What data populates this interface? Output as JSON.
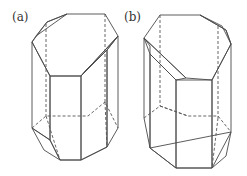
{
  "figure": {
    "panels": [
      {
        "id": "a",
        "label": "(a)",
        "description": "Hexagonal prism crystal with truncated top corner faces (left orientation)"
      },
      {
        "id": "b",
        "label": "(b)",
        "description": "Hexagonal prism crystal with truncated top corner faces (mirrored orientation)"
      }
    ],
    "colors": {
      "top_face": "#ececec",
      "front_face": "#c8c8c8",
      "side_face_light": "#dedede",
      "side_face_mid": "#d2d2d2",
      "bevel_face": "#bdbdbd",
      "bottom_face": "#e4e4e4",
      "edge": "#4a4a4a",
      "background": "#ffffff"
    }
  }
}
